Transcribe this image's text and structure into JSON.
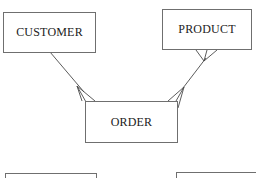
{
  "diagram": {
    "type": "entity-relationship",
    "entities": [
      {
        "id": "customer",
        "label": "CUSTOMER"
      },
      {
        "id": "product",
        "label": "PRODUCT"
      },
      {
        "id": "order",
        "label": "ORDER"
      },
      {
        "id": "bottom-left",
        "label": ""
      },
      {
        "id": "bottom-right",
        "label": ""
      }
    ],
    "relationships": [
      {
        "from": "customer",
        "to": "order",
        "from_cardinality": "one",
        "to_cardinality": "many"
      },
      {
        "from": "product",
        "to": "order",
        "from_cardinality": "many",
        "to_cardinality": "many"
      }
    ],
    "colors": {
      "line": "#4a4a4a",
      "border": "#6f6f6f",
      "text": "#222222",
      "background": "#ffffff"
    }
  }
}
